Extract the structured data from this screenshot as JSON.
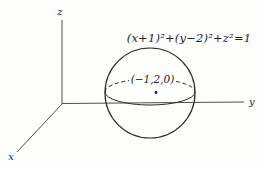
{
  "figure": {
    "equation_label": "(x+1)²+(y−2)²+z²=1",
    "center_point_label": "(−1,2,0)",
    "axes": {
      "x_label": "x",
      "y_label": "y",
      "z_label": "z"
    },
    "colors": {
      "background": "#fdfdfc",
      "sphere_line": "#2b2b2b",
      "axis_line": "#4f4f4f",
      "text": "#1e1e1e"
    }
  }
}
